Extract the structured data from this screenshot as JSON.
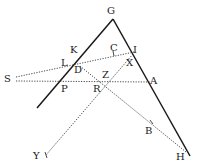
{
  "diagram": {
    "type": "geometric-construction",
    "points": {
      "G": {
        "label": "G",
        "x": 112,
        "y": 13
      },
      "K": {
        "label": "K",
        "x": 76,
        "y": 52
      },
      "L": {
        "label": "L",
        "x": 68,
        "y": 64
      },
      "D": {
        "label": "D",
        "x": 82,
        "y": 71
      },
      "C": {
        "label": "C",
        "x": 115,
        "y": 48
      },
      "I": {
        "label": "I",
        "x": 136,
        "y": 50
      },
      "X": {
        "label": "X",
        "x": 131,
        "y": 63
      },
      "S": {
        "label": "S",
        "x": 8,
        "y": 79
      },
      "P": {
        "label": "P",
        "x": 66,
        "y": 89
      },
      "Z": {
        "label": "Z",
        "x": 107,
        "y": 75
      },
      "R": {
        "label": "R",
        "x": 97,
        "y": 88
      },
      "A": {
        "label": "A",
        "x": 152,
        "y": 80
      },
      "B": {
        "label": "B",
        "x": 147,
        "y": 130
      },
      "Y": {
        "label": "Y",
        "x": 36,
        "y": 155
      },
      "H": {
        "label": "H",
        "x": 178,
        "y": 156
      }
    },
    "lines": [
      {
        "name": "GP-line",
        "style": "solid"
      },
      {
        "name": "GH-line",
        "style": "solid"
      },
      {
        "name": "SC-line",
        "style": "dotted"
      },
      {
        "name": "SA-line",
        "style": "dotted"
      },
      {
        "name": "DH-line",
        "style": "dotted"
      },
      {
        "name": "XY-line",
        "style": "dotted"
      }
    ]
  }
}
